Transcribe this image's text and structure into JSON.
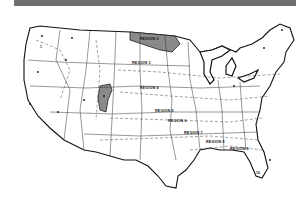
{
  "map": {
    "type": "regional climate zone map",
    "area": "Contiguous United States",
    "colors": {
      "background": "#ffffff",
      "line": "#111111",
      "shaded_region": "#8a8a8a",
      "header_bar": "#6f6f6f"
    },
    "regions": [
      {
        "id": 1,
        "label": "1"
      },
      {
        "id": 2,
        "label": "REGION 2"
      },
      {
        "id": 3,
        "label": "REGION 3"
      },
      {
        "id": 4,
        "label": "REGION 4"
      },
      {
        "id": 5,
        "label": "REGION 5"
      },
      {
        "id": 6,
        "label": "REGION 6"
      },
      {
        "id": 7,
        "label": "REGION 7"
      },
      {
        "id": 8,
        "label": "REGION 8"
      },
      {
        "id": 9,
        "label": "REGION 9"
      },
      {
        "id": 10,
        "label": "10"
      }
    ]
  }
}
